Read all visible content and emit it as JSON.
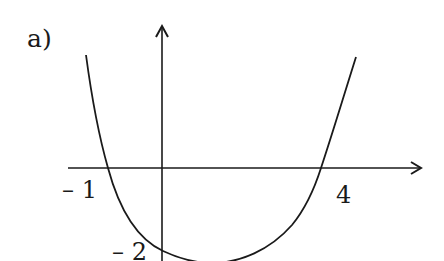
{
  "figure": {
    "part_label": "a)",
    "x_axis": {
      "tick_labels": {
        "left_root": "– 1",
        "right_root": "4"
      }
    },
    "y_axis": {
      "tick_labels": {
        "intercept": "– 2"
      }
    },
    "curve": {
      "description": "Polynomial curve crossing x-axis at -1 and 4, y-intercept at -2, opening upward",
      "x_intercepts": [
        -1,
        4
      ],
      "y_intercept": -2
    },
    "colors": {
      "stroke": "#1a1a1a",
      "background": "#ffffff"
    }
  }
}
